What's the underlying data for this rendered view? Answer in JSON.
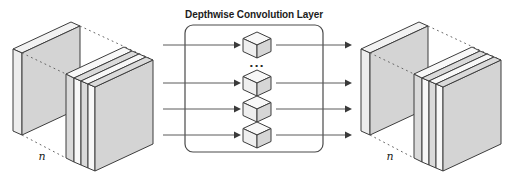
{
  "diagram": {
    "title": "Depthwise Convolution Layer",
    "ellipsis": "...",
    "input_tensor": {
      "depth_label": "n"
    },
    "output_tensor": {
      "depth_label": "n"
    },
    "kernels_shown": 4,
    "input_arrows_shown": 4,
    "output_arrows_shown": 4,
    "colors": {
      "background": "#ffffff",
      "slab_face_gray": "#d4d4d4",
      "stripe_light": "#f8f8f8",
      "stripe_gray": "#dadada",
      "outline": "#3d3d3d",
      "cube_top": "#f8f8f8",
      "cube_left": "#efefef",
      "cube_right": "#d6d6d6",
      "arrow_line": "#5a5a5a",
      "arrow_head": "#3a3a3a",
      "layer_box_border": "#4a4a4a",
      "dotted_line": "#666666",
      "title_text": "#1c1c1c"
    }
  }
}
